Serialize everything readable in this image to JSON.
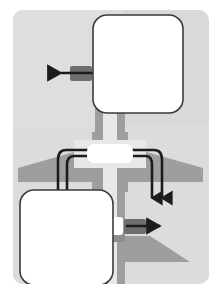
{
  "figure": {
    "canvas": {
      "width": 221,
      "height": 295
    }
  },
  "colors": {
    "page_background": "#ffffff",
    "panel_background": "#d9d9d9",
    "panel_background_light": "#e2e2e2",
    "aircraft_body": "#9e9e9e",
    "aircraft_body_dark": "#8f8f8f",
    "aircraft_highlight": "#e8e8e8",
    "callout_fill": "#ffffff",
    "callout_stroke": "#3a3a3a",
    "arrow_stroke": "#1c1c1c",
    "arrow_tail_block": "#6e6e6e"
  },
  "panel": {
    "name": "diagram-panel",
    "x": 13,
    "y": 10,
    "width": 196,
    "height": 274,
    "corner_radius": 10
  },
  "aircraft": {
    "name": "aircraft-silhouette",
    "orientation": "nose-up",
    "fuselage": {
      "x": 93,
      "y": 100,
      "width": 34,
      "height": 185
    },
    "fuselage_highlight": {
      "x": 103,
      "y": 100,
      "width": 14,
      "height": 185
    },
    "wing_span_left_x": 18,
    "wing_span_right_x": 203,
    "wing_band_y": 150,
    "wing_band_height": 22,
    "tailplane_y": 236,
    "cross_band_y": 140,
    "cross_band_height": 28
  },
  "callouts": [
    {
      "id": "callout-upper-right",
      "name": "callout-box-upper",
      "x": 93,
      "y": 15,
      "width": 90,
      "height": 98,
      "corner_radius": 14,
      "label": ""
    },
    {
      "id": "callout-lower-left",
      "name": "callout-box-lower",
      "x": 20,
      "y": 190,
      "width": 93,
      "height": 95,
      "corner_radius": 14,
      "label": ""
    },
    {
      "id": "callout-center",
      "name": "callout-box-center",
      "x": 87,
      "y": 144,
      "width": 46,
      "height": 19,
      "corner_radius": 7,
      "label": ""
    },
    {
      "id": "callout-small-tail",
      "name": "callout-box-tail",
      "x": 105,
      "y": 217,
      "width": 18,
      "height": 18,
      "corner_radius": 3,
      "label": ""
    }
  ],
  "arrows": [
    {
      "id": "arrow-out-left",
      "name": "arrow-out-left",
      "direction": "left",
      "from_x": 93,
      "to_x": 57,
      "y": 73,
      "has_tail_block": true,
      "tail_block": {
        "x": 70,
        "y": 66,
        "width": 22,
        "height": 15
      }
    },
    {
      "id": "arrow-out-right",
      "name": "arrow-out-right",
      "direction": "right",
      "from_x": 124,
      "to_x": 163,
      "y": 226,
      "has_tail_block": true,
      "tail_block": {
        "x": 124,
        "y": 219,
        "width": 22,
        "height": 15
      }
    },
    {
      "id": "arrow-curve-left-inner",
      "name": "arrow-curve-left-inner",
      "direction": "down",
      "start_x": 87,
      "start_y": 154,
      "turn_x": 70,
      "end_y": 200,
      "arrowhead": false
    },
    {
      "id": "arrow-curve-left-outer",
      "name": "arrow-curve-left-outer",
      "direction": "down",
      "start_x": 87,
      "start_y": 150,
      "turn_x": 61,
      "end_y": 200,
      "arrowhead": false
    },
    {
      "id": "arrow-curve-right-inner",
      "name": "arrow-curve-right-inner",
      "direction": "down",
      "start_x": 133,
      "start_y": 150,
      "turn_x": 150,
      "end_y": 203,
      "arrowhead": true
    },
    {
      "id": "arrow-curve-right-outer",
      "name": "arrow-curve-right-outer",
      "direction": "down",
      "start_x": 133,
      "start_y": 154,
      "turn_x": 162,
      "end_y": 203,
      "arrowhead": true
    }
  ],
  "legend": {
    "visible": false,
    "entries": []
  }
}
